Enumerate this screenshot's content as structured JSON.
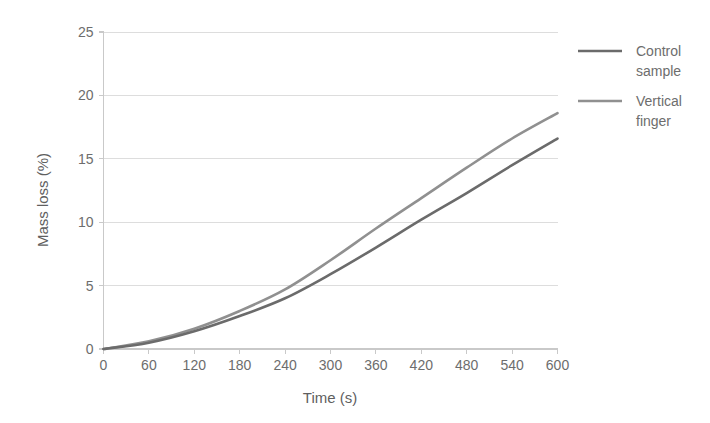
{
  "chart_data": {
    "type": "line",
    "title": "",
    "xlabel": "Time (s)",
    "ylabel": "Mass loss (%)",
    "xlim": [
      0,
      600
    ],
    "ylim": [
      0,
      25
    ],
    "xticks": [
      0,
      60,
      120,
      180,
      240,
      300,
      360,
      420,
      480,
      540,
      600
    ],
    "yticks": [
      0,
      5,
      10,
      15,
      20,
      25
    ],
    "xtick_labels": [
      "0",
      "60",
      "120",
      "180",
      "240",
      "300",
      "360",
      "420",
      "480",
      "540",
      "600"
    ],
    "ytick_labels": [
      "0",
      "5",
      "10",
      "15",
      "20",
      "25"
    ],
    "grid": "horizontal",
    "legend_position": "right",
    "x": [
      0,
      60,
      120,
      180,
      240,
      300,
      360,
      420,
      480,
      540,
      600
    ],
    "series": [
      {
        "name": "Control sample",
        "label_lines": [
          "Control",
          "sample"
        ],
        "color": "#6b6b6b",
        "values": [
          0,
          0.5,
          1.4,
          2.6,
          4.0,
          5.9,
          8.0,
          10.2,
          12.3,
          14.5,
          16.6
        ]
      },
      {
        "name": "Vertical finger",
        "label_lines": [
          "Vertical",
          "finger"
        ],
        "color": "#909090",
        "values": [
          0,
          0.6,
          1.6,
          3.0,
          4.7,
          7.0,
          9.5,
          11.9,
          14.3,
          16.6,
          18.6
        ]
      }
    ]
  },
  "axes": {
    "x_title": "Time (s)",
    "y_title": "Mass loss (%)"
  },
  "legend": {
    "entries": [
      {
        "line1": "Control",
        "line2": "sample",
        "color": "#6b6b6b"
      },
      {
        "line1": "Vertical",
        "line2": "finger",
        "color": "#909090"
      }
    ]
  },
  "colors": {
    "background": "#ffffff",
    "gridline": "#d9d9d9",
    "axis": "#c9c9c9",
    "text": "#6d6d6d",
    "series_1": "#6b6b6b",
    "series_2": "#909090"
  }
}
